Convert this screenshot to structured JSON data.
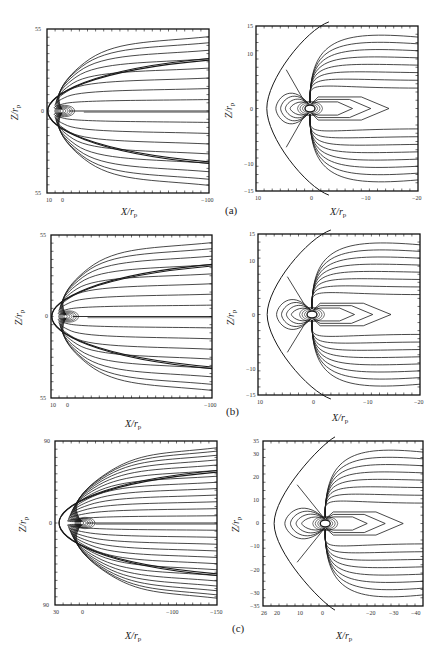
{
  "figure": {
    "rows": [
      {
        "label": "(a)",
        "left": {
          "xlabel": "X/r",
          "xlabel_sub": "p",
          "ylabel": "Z/r",
          "ylabel_sub": "p",
          "x_ticks": [
            "10",
            "0",
            "−100"
          ],
          "y_ticks": [
            "55",
            "0",
            "55"
          ]
        },
        "right": {
          "xlabel": "X/r",
          "xlabel_sub": "p",
          "ylabel": "Z/r",
          "ylabel_sub": "p",
          "x_ticks": [
            "10",
            "0",
            "−10",
            "−20"
          ],
          "y_ticks": [
            "15",
            "10",
            "0",
            "−10",
            "−15"
          ]
        }
      },
      {
        "label": "(b)",
        "left": {
          "xlabel": "X/r",
          "xlabel_sub": "p",
          "ylabel": "Z/r",
          "ylabel_sub": "p",
          "x_ticks": [
            "10",
            "0",
            "−100"
          ],
          "y_ticks": [
            "55",
            "0",
            "55"
          ]
        },
        "right": {
          "xlabel": "X/r",
          "xlabel_sub": "p",
          "ylabel": "Z/r",
          "ylabel_sub": "p",
          "x_ticks": [
            "10",
            "0",
            "−10",
            "−20"
          ],
          "y_ticks": [
            "15",
            "10",
            "0",
            "−10",
            "−15"
          ]
        }
      },
      {
        "label": "(c)",
        "left": {
          "xlabel": "X/r",
          "xlabel_sub": "p",
          "ylabel": "Z/r",
          "ylabel_sub": "p",
          "x_ticks": [
            "30",
            "0",
            "−100",
            "−150"
          ],
          "y_ticks": [
            "90",
            "0",
            "90"
          ]
        },
        "right": {
          "xlabel": "X/r",
          "xlabel_sub": "p",
          "ylabel": "Z/r",
          "ylabel_sub": "p",
          "x_ticks": [
            "26",
            "20",
            "10",
            "0",
            "−20",
            "−30",
            "−40"
          ],
          "y_ticks": [
            "35",
            "30",
            "20",
            "10",
            "0",
            "−10",
            "−20",
            "−30",
            "−35"
          ]
        }
      }
    ]
  },
  "style": {
    "line_color": "#1a1a1a",
    "frame_color": "#111111",
    "background": "#ffffff"
  }
}
